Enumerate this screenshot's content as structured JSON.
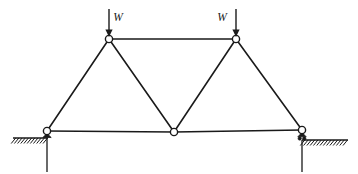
{
  "figure": {
    "canvas": {
      "width": 358,
      "height": 174,
      "background": "#ffffff"
    },
    "line_color": "#1a1a1a"
  },
  "loads": [
    {
      "id": "load-left",
      "label": "W",
      "label_x": 118,
      "label_y": 18,
      "arrow_x": 109,
      "arrow_top_y": 9,
      "arrow_tip_y": 37,
      "applied_at_joint": "top-left"
    },
    {
      "id": "load-right",
      "label": "W",
      "label_x": 222,
      "label_y": 18,
      "arrow_x": 236,
      "arrow_top_y": 9,
      "arrow_tip_y": 37,
      "applied_at_joint": "top-right"
    }
  ],
  "joints": [
    {
      "id": "top-left",
      "name": "joint-top-left",
      "x": 109,
      "y": 39,
      "r": 3.6
    },
    {
      "id": "top-right",
      "name": "joint-top-right",
      "x": 236,
      "y": 39,
      "r": 3.6
    },
    {
      "id": "bottom-left",
      "name": "joint-bottom-left",
      "x": 47,
      "y": 131,
      "r": 3.6
    },
    {
      "id": "bottom-center",
      "name": "joint-bottom-center",
      "x": 174,
      "y": 132,
      "r": 3.6
    },
    {
      "id": "bottom-right",
      "name": "joint-bottom-right",
      "x": 302,
      "y": 130,
      "r": 3.6
    }
  ],
  "members": [
    {
      "id": "top-chord",
      "from": "top-left",
      "to": "top-right"
    },
    {
      "id": "bottom-chord-left",
      "from": "bottom-left",
      "to": "bottom-center"
    },
    {
      "id": "bottom-chord-right",
      "from": "bottom-center",
      "to": "bottom-right"
    },
    {
      "id": "diagonal-1",
      "from": "bottom-left",
      "to": "top-left"
    },
    {
      "id": "diagonal-2",
      "from": "top-left",
      "to": "bottom-center"
    },
    {
      "id": "diagonal-3",
      "from": "bottom-center",
      "to": "top-right"
    },
    {
      "id": "diagonal-4",
      "from": "top-right",
      "to": "bottom-right"
    }
  ],
  "supports": [
    {
      "id": "support-left",
      "type": "pin",
      "joint": "bottom-left",
      "ground_y": 138,
      "ground_x_start": 13,
      "ground_x_end": 48,
      "hatch_count": 11,
      "post_x": 47,
      "post_y_end": 172
    },
    {
      "id": "support-right",
      "type": "roller",
      "joint": "bottom-right",
      "ground_y": 140,
      "ground_x_start": 302,
      "ground_x_end": 348,
      "hatch_count": 14,
      "post_x": 302,
      "post_y_end": 172
    }
  ]
}
